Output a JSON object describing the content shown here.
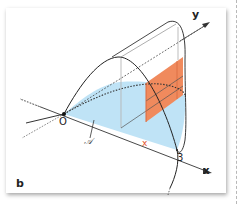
{
  "figure": {
    "panel_label": "b",
    "axes": {
      "x_label": "x",
      "y_label": "y",
      "origin_label": "O"
    },
    "tick_label": "3",
    "slice_position_label": "x",
    "region_label": "𝒜",
    "colors": {
      "base_region": "#bfe3f6",
      "cross_section": "#f08a5d",
      "cross_section_label": "#e2532d",
      "lines": "#333333",
      "guides": "#b5b5b5"
    }
  }
}
